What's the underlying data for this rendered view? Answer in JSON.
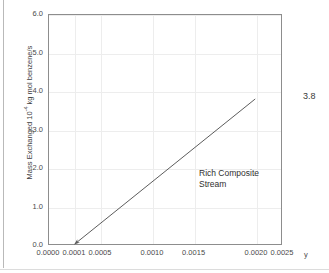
{
  "chart_data": {
    "type": "line",
    "title": "",
    "xlabel": "y",
    "ylabel_parts": {
      "pre": "Mass Exchanged 10",
      "exponent": "-4",
      "post": " kg mol benzene/s"
    },
    "ylabel": "Mass Exchanged 10-4 kg mol benzene/s",
    "grid": true,
    "legend": "none",
    "xlim": [
      0.0,
      0.0025
    ],
    "ylim": [
      0.0,
      6.0
    ],
    "xticks": [
      "0.0000",
      "0.0001",
      "0.0005",
      "0.0010",
      "0.0015",
      "0.0020",
      "0.0025"
    ],
    "xtick_values": [
      0.0,
      0.0001,
      0.0005,
      0.001,
      0.0015,
      0.002,
      0.0025
    ],
    "xtick_positions_frac": [
      0.0,
      0.1111,
      0.2222,
      0.4444,
      0.6222,
      0.8889,
      1.0
    ],
    "yticks": [
      "0.0",
      "1.0",
      "2.0",
      "3.0",
      "4.0",
      "5.0",
      "6.0"
    ],
    "ytick_values": [
      0.0,
      1.0,
      2.0,
      3.0,
      4.0,
      5.0,
      6.0
    ],
    "series": [
      {
        "name": "Rich Composite Stream",
        "x": [
          0.0001,
          0.002
        ],
        "y": [
          0.0,
          3.8
        ],
        "color": "#5a5a5a",
        "arrow_at_start": true
      }
    ],
    "annotations": [
      {
        "name": "series-annotation",
        "text_line1": "Rich Composite",
        "text_line2": "Stream"
      },
      {
        "name": "endpoint-value-label",
        "text": "3.8"
      }
    ]
  },
  "axes": {
    "x_unit_symbol": "y"
  },
  "annotation": {
    "line1": "Rich Composite",
    "line2": "Stream",
    "endpoint_value": "3.8"
  },
  "colors": {
    "frame": "#8d8d8d",
    "grid": "#ededed",
    "series": "#5a5a5a",
    "text": "#3a3a3a",
    "background": "#ffffff"
  }
}
